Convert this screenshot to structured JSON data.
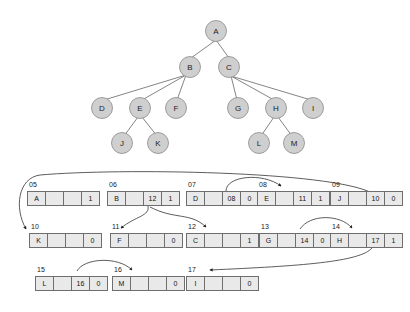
{
  "diagram": {
    "colors": {
      "node_fill": "#cfcfcf",
      "node_stroke": "#8a8a8a",
      "cell_fill": "#e9e9e9",
      "cell_stroke": "#6e6e6e",
      "edge": "#555555",
      "pointer_curve": "#333333",
      "background": "#ffffff"
    },
    "tree": {
      "nodes": [
        {
          "id": "A",
          "label": "A",
          "cx": 216,
          "cy": 31
        },
        {
          "id": "B",
          "label": "B",
          "cx": 190,
          "cy": 67
        },
        {
          "id": "C",
          "label": "C",
          "cx": 229,
          "cy": 67
        },
        {
          "id": "D",
          "label": "D",
          "cx": 102,
          "cy": 108
        },
        {
          "id": "E",
          "label": "E",
          "cx": 140,
          "cy": 108
        },
        {
          "id": "F",
          "label": "F",
          "cx": 176,
          "cy": 108
        },
        {
          "id": "G",
          "label": "G",
          "cx": 238,
          "cy": 108
        },
        {
          "id": "H",
          "label": "H",
          "cx": 276,
          "cy": 108
        },
        {
          "id": "I",
          "label": "I",
          "cx": 313,
          "cy": 108
        },
        {
          "id": "J",
          "label": "J",
          "cx": 122,
          "cy": 143
        },
        {
          "id": "K",
          "label": "K",
          "cx": 158,
          "cy": 143
        },
        {
          "id": "L",
          "label": "L",
          "cx": 259,
          "cy": 143
        },
        {
          "id": "M",
          "label": "M",
          "cx": 294,
          "cy": 143
        }
      ],
      "edges": [
        {
          "from": "A",
          "to": "B"
        },
        {
          "from": "A",
          "to": "C"
        },
        {
          "from": "B",
          "to": "D"
        },
        {
          "from": "B",
          "to": "E"
        },
        {
          "from": "B",
          "to": "F"
        },
        {
          "from": "C",
          "to": "G"
        },
        {
          "from": "C",
          "to": "H"
        },
        {
          "from": "C",
          "to": "I"
        },
        {
          "from": "E",
          "to": "J"
        },
        {
          "from": "E",
          "to": "K"
        },
        {
          "from": "H",
          "to": "L"
        },
        {
          "from": "H",
          "to": "M"
        }
      ]
    },
    "memory": {
      "rows": [
        [
          {
            "address": "05",
            "cells": [
              "A",
              "",
              "",
              "1"
            ],
            "x": 27,
            "y": 191
          },
          {
            "address": "06",
            "cells": [
              "B",
              "",
              "12",
              "1"
            ],
            "x": 107,
            "y": 191
          },
          {
            "address": "07",
            "cells": [
              "D",
              "",
              "08",
              "0"
            ],
            "x": 186,
            "y": 191
          },
          {
            "address": "08",
            "cells": [
              "E",
              "",
              "11",
              "1"
            ],
            "x": 257,
            "y": 191
          },
          {
            "address": "09",
            "cells": [
              "J",
              "",
              "10",
              "0"
            ],
            "x": 330,
            "y": 191
          }
        ],
        [
          {
            "address": "10",
            "cells": [
              "K",
              "",
              "",
              "0"
            ],
            "x": 29,
            "y": 233
          },
          {
            "address": "11",
            "cells": [
              "F",
              "",
              "",
              "0"
            ],
            "x": 110,
            "y": 233
          },
          {
            "address": "12",
            "cells": [
              "C",
              "",
              "",
              "1"
            ],
            "x": 186,
            "y": 233
          },
          {
            "address": "13",
            "cells": [
              "G",
              "",
              "14",
              "0"
            ],
            "x": 259,
            "y": 233
          },
          {
            "address": "14",
            "cells": [
              "H",
              "",
              "17",
              "1"
            ],
            "x": 330,
            "y": 233
          }
        ],
        [
          {
            "address": "15",
            "cells": [
              "L",
              "",
              "16",
              "0"
            ],
            "x": 35,
            "y": 276
          },
          {
            "address": "16",
            "cells": [
              "M",
              "",
              "",
              "0"
            ],
            "x": 112,
            "y": 276
          },
          {
            "address": "17",
            "cells": [
              "I",
              "",
              "",
              "0"
            ],
            "x": 186,
            "y": 276
          }
        ]
      ],
      "pointer_links": [
        {
          "from": "09",
          "to": "10",
          "label": "J next -> K"
        },
        {
          "from": "06",
          "to": "11",
          "label": "B -> F"
        },
        {
          "from": "06",
          "to": "12",
          "label": "B next -> C"
        },
        {
          "from": "07",
          "to": "08",
          "label": "D next -> E"
        },
        {
          "from": "13",
          "to": "14",
          "label": "G next -> H"
        },
        {
          "from": "14",
          "to": "17",
          "label": "H next -> I"
        },
        {
          "from": "15",
          "to": "16",
          "label": "L next -> M"
        }
      ]
    }
  }
}
